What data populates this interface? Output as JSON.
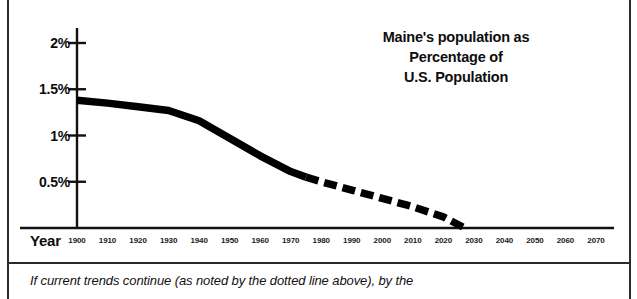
{
  "chart_data": {
    "type": "line",
    "title": "Maine's population as Percentage of U.S. Population",
    "title_lines": [
      "Maine's population as",
      "Percentage of",
      "U.S. Population"
    ],
    "xlabel": "Year",
    "ylabel": "",
    "xlim": [
      1900,
      2070
    ],
    "ylim": [
      0,
      2.2
    ],
    "grid": false,
    "legend": null,
    "ytick_labels": [
      "2%",
      "1.5%",
      "1%",
      "0.5%"
    ],
    "ytick_values": [
      2,
      1.5,
      1,
      0.5
    ],
    "xtick_labels": [
      "1900",
      "1910",
      "1920",
      "1930",
      "1940",
      "1950",
      "1960",
      "1970",
      "1980",
      "1990",
      "2000",
      "2010",
      "2020",
      "2030",
      "2040",
      "2050",
      "2060",
      "2070"
    ],
    "xtick_values": [
      1900,
      1910,
      1920,
      1930,
      1940,
      1950,
      1960,
      1970,
      1980,
      1990,
      2000,
      2010,
      2020,
      2030,
      2040,
      2050,
      2060,
      2070
    ],
    "series": [
      {
        "name": "Historical (solid)",
        "style": "solid",
        "x": [
          1900,
          1910,
          1920,
          1930,
          1940,
          1950,
          1960,
          1970,
          1975
        ],
        "values": [
          1.38,
          1.35,
          1.31,
          1.27,
          1.16,
          0.97,
          0.78,
          0.61,
          0.55
        ]
      },
      {
        "name": "Projected (dotted line above)",
        "style": "dashed",
        "x": [
          1975,
          1980,
          1990,
          2000,
          2010,
          2020,
          2027
        ],
        "values": [
          0.55,
          0.5,
          0.41,
          0.32,
          0.23,
          0.12,
          0.0
        ]
      }
    ],
    "annotation": "If current trends continue (as noted by the dotted line above), by the"
  },
  "caption": {
    "text": "If current trends continue (as noted by the dotted line above), by the"
  },
  "colors": {
    "line": "#000000",
    "axis": "#111111",
    "text": "#0d0d0d",
    "background": "#ffffff"
  }
}
